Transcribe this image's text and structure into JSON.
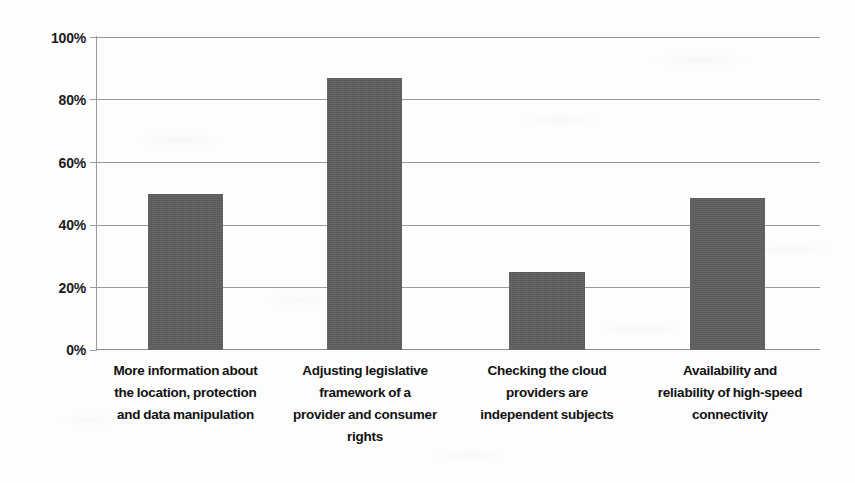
{
  "chart_data": {
    "type": "bar",
    "title": "",
    "subtitle": "",
    "xlabel": "",
    "ylabel": "",
    "ylim": [
      0,
      100
    ],
    "grid": true,
    "legend": false,
    "legend_position": "none",
    "y_tick_labels": [
      "100%",
      "80%",
      "60%",
      "40%",
      "20%",
      "0%"
    ],
    "y_ticks": [
      100,
      80,
      60,
      40,
      20,
      0
    ],
    "bar_color": "#5e5e5e",
    "categories": [
      "More information about the location, protection and data manipulation",
      "Adjusting legislative framework of a provider and consumer rights",
      "Checking the cloud providers are independent subjects",
      "Availability and reliability of high-speed connectivity"
    ],
    "category_lines": [
      [
        "More information about",
        "the location, protection",
        "and data manipulation"
      ],
      [
        "Adjusting legislative",
        "framework of a",
        "provider and consumer",
        "rights"
      ],
      [
        "Checking the cloud",
        "providers are",
        "independent subjects"
      ],
      [
        "Availability and",
        "reliability of high-speed",
        "connectivity"
      ]
    ],
    "values": [
      50,
      87,
      25,
      48.5
    ],
    "value_labels": [
      "50%",
      "87%",
      "25%",
      "48.5%"
    ],
    "series": [
      {
        "name": "Share of respondents",
        "values": [
          50,
          87,
          25,
          48.5
        ]
      }
    ]
  }
}
